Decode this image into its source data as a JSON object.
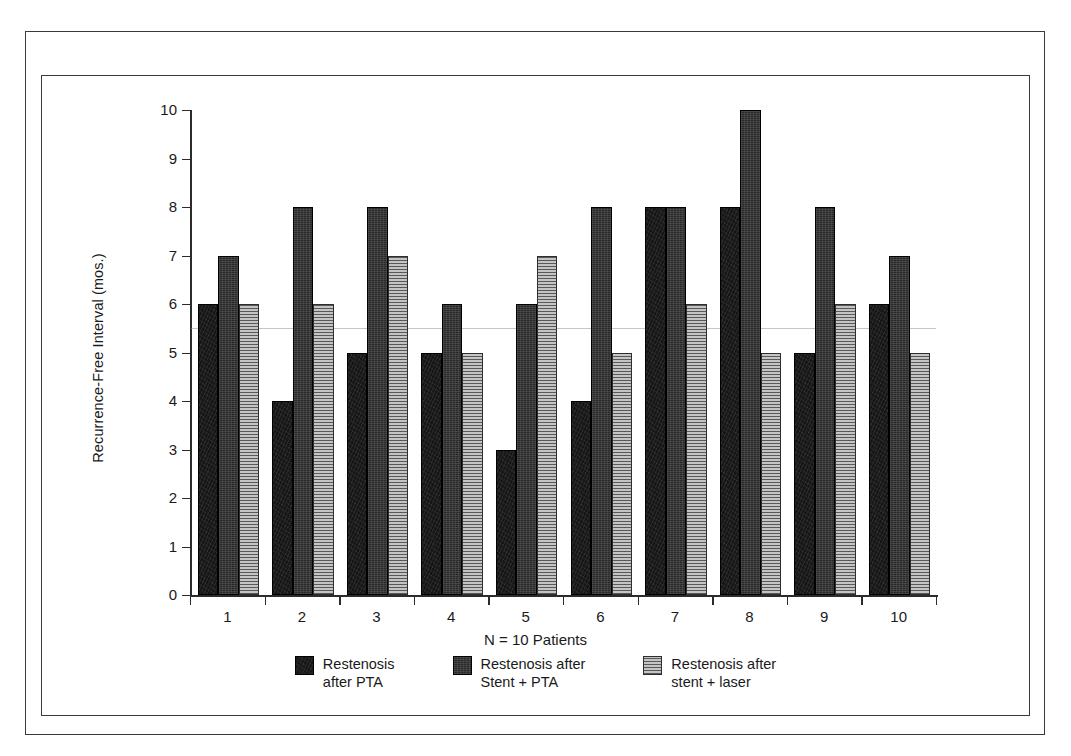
{
  "chart_data": {
    "type": "bar",
    "title": "",
    "xlabel": "",
    "ylabel": "Recurrence-Free Interval (mos.)",
    "categories": [
      "1",
      "2",
      "3",
      "4",
      "5",
      "6",
      "7",
      "8",
      "9",
      "10"
    ],
    "ylim": [
      0,
      10
    ],
    "ytick_labels": [
      "0",
      "1",
      "2",
      "3",
      "4",
      "5",
      "6",
      "7",
      "8",
      "9",
      "10"
    ],
    "ytick_values": [
      0,
      1,
      2,
      3,
      4,
      5,
      6,
      7,
      8,
      9,
      10
    ],
    "grid": false,
    "legend_position": "bottom",
    "annotation": "N = 10 Patients",
    "series": [
      {
        "name": "Restenosis\nafter PTA",
        "color": "#161616",
        "pattern": "dense-dark",
        "values": [
          6,
          4,
          5,
          5,
          3,
          4,
          8,
          8,
          5,
          6
        ]
      },
      {
        "name": "Restenosis after\nStent + PTA",
        "color": "#2a2a2a",
        "pattern": "speckled-dark",
        "values": [
          7,
          8,
          8,
          6,
          6,
          8,
          8,
          10,
          8,
          7
        ]
      },
      {
        "name": "Restenosis after\nstent + laser",
        "color": "#9d9d9d",
        "pattern": "horizontal-lines",
        "values": [
          6,
          6,
          7,
          5,
          7,
          5,
          6,
          5,
          6,
          5
        ]
      }
    ]
  },
  "figure": {
    "y_axis_title": "Recurrence-Free Interval (mos.)",
    "n_note": "N = 10 Patients"
  },
  "legend": {
    "items": [
      {
        "label": "Restenosis\nafter PTA",
        "swatch": "series-1-swatch"
      },
      {
        "label": "Restenosis after\nStent + PTA",
        "swatch": "series-2-swatch"
      },
      {
        "label": "Restenosis after\nstent + laser",
        "swatch": "series-3-swatch"
      }
    ]
  }
}
